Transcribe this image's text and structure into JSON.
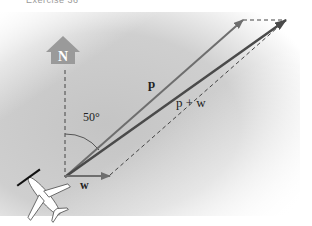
{
  "caption": "Exercise 36",
  "north_label": "N",
  "vectors": {
    "p": {
      "label": "p",
      "color": "#6e6e6e"
    },
    "w": {
      "label": "w",
      "color": "#6e6e6e"
    },
    "sum": {
      "label": "p + w",
      "color": "#4a4a4a"
    }
  },
  "angle_label": "50°",
  "colors": {
    "background_panel": "#c8c8c8",
    "north_sign": "#9a9a9a",
    "dashed": "#555555"
  }
}
